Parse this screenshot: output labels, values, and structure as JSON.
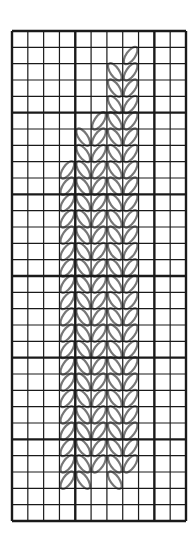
{
  "diagram": {
    "type": "knitting-chart",
    "grid": {
      "columns": 11,
      "rows": 30,
      "left": 12,
      "top": 31,
      "right": 186,
      "bottom": 521,
      "bold_every": 5,
      "bold_columns": [
        0,
        4,
        9,
        11
      ],
      "bold_rows": [
        0,
        5,
        10,
        15,
        20,
        25,
        30
      ],
      "line_color": "#1a1a1a",
      "stitch_color": "#777777"
    },
    "stitch_columns": [
      {
        "col": 3,
        "leaf": "right",
        "row_start": 8,
        "row_end": 27
      },
      {
        "col": 4,
        "leaf": "left",
        "row_start": 6,
        "row_end": 27
      },
      {
        "col": 5,
        "leaf": "right",
        "row_start": 5,
        "row_end": 26
      },
      {
        "col": 6,
        "leaf": "left",
        "row_start": 2,
        "row_end": 27
      },
      {
        "col": 7,
        "leaf": "right",
        "row_start": 1,
        "row_end": 26
      }
    ]
  }
}
